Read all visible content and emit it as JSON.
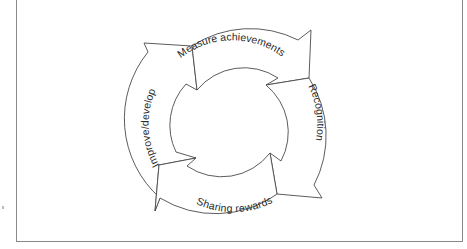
{
  "diagram": {
    "type": "cycle",
    "center": [
      233,
      124
    ],
    "outer_radius": 106,
    "inner_radius": 61,
    "colors": {
      "stroke": "#4a4a4a",
      "fill": "#ffffff",
      "text": "#2a2a2a",
      "frame": "#8a8a8a"
    },
    "steps": [
      {
        "id": "measure",
        "label": "Measure achievements"
      },
      {
        "id": "recognition",
        "label": "Recognition"
      },
      {
        "id": "sharing",
        "label": "Sharing rewards"
      },
      {
        "id": "improve",
        "label": "Improve/develop"
      }
    ],
    "flow": [
      "Measure achievements",
      "Recognition",
      "Sharing rewards",
      "Improve/develop"
    ]
  }
}
